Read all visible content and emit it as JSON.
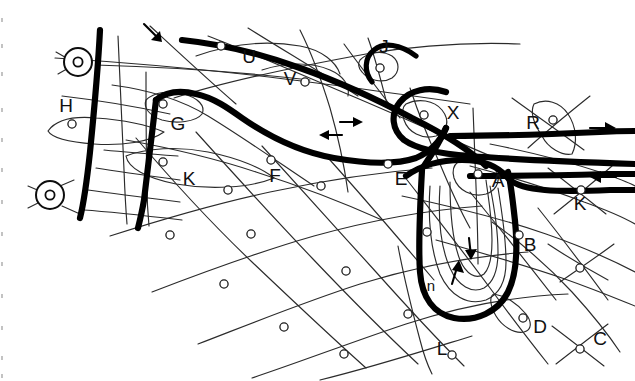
{
  "diagram": {
    "background_color": "#ffffff",
    "ink_color": "#000000",
    "width": 635,
    "height": 381,
    "labels": [
      {
        "id": "H",
        "text": "H",
        "x": 66,
        "y": 107
      },
      {
        "id": "G",
        "text": "G",
        "x": 178,
        "y": 125
      },
      {
        "id": "K1",
        "text": "K",
        "x": 189,
        "y": 180
      },
      {
        "id": "F",
        "text": "F",
        "x": 275,
        "y": 177
      },
      {
        "id": "U",
        "text": "U",
        "x": 249,
        "y": 58
      },
      {
        "id": "V",
        "text": "V",
        "x": 290,
        "y": 80
      },
      {
        "id": "J",
        "text": "J",
        "x": 384,
        "y": 48
      },
      {
        "id": "X",
        "text": "X",
        "x": 453,
        "y": 114
      },
      {
        "id": "E",
        "text": "E",
        "x": 401,
        "y": 180
      },
      {
        "id": "A",
        "text": "A",
        "x": 498,
        "y": 182
      },
      {
        "id": "R",
        "text": "R",
        "x": 533,
        "y": 124
      },
      {
        "id": "K2",
        "text": "K",
        "x": 580,
        "y": 205
      },
      {
        "id": "B",
        "text": "B",
        "x": 530,
        "y": 246
      },
      {
        "id": "n",
        "text": "n",
        "x": 431,
        "y": 287
      },
      {
        "id": "D",
        "text": "D",
        "x": 540,
        "y": 328
      },
      {
        "id": "C",
        "text": "C",
        "x": 600,
        "y": 340
      },
      {
        "id": "L",
        "text": "L",
        "x": 442,
        "y": 350
      }
    ],
    "arrows": [
      {
        "id": "top-diagonal-arrow",
        "direction": "down-right",
        "x": 152,
        "y": 30
      },
      {
        "id": "mid-right-arrow",
        "direction": "right",
        "x": 352,
        "y": 122
      },
      {
        "id": "mid-left-arrow",
        "direction": "left",
        "x": 331,
        "y": 135
      },
      {
        "id": "far-right-arrow",
        "direction": "right",
        "x": 604,
        "y": 132
      },
      {
        "id": "far-right-back-arrow",
        "direction": "left",
        "x": 604,
        "y": 177
      },
      {
        "id": "loop-down-arrow",
        "direction": "down",
        "x": 471,
        "y": 248
      },
      {
        "id": "loop-up-arrow",
        "direction": "up",
        "x": 457,
        "y": 272
      }
    ],
    "station_symbols": [
      {
        "id": "station-upper-left",
        "x": 78,
        "y": 62
      },
      {
        "id": "station-lower-left",
        "x": 50,
        "y": 195
      }
    ],
    "nodes": [
      {
        "id": "node-H",
        "x": 72,
        "y": 124
      },
      {
        "id": "node-G",
        "x": 163,
        "y": 104
      },
      {
        "id": "node-U",
        "x": 221,
        "y": 46
      },
      {
        "id": "node-V",
        "x": 305,
        "y": 82
      },
      {
        "id": "node-J",
        "x": 380,
        "y": 68
      },
      {
        "id": "node-X",
        "x": 424,
        "y": 115
      },
      {
        "id": "node-R",
        "x": 553,
        "y": 120
      },
      {
        "id": "node-K1",
        "x": 163,
        "y": 162
      },
      {
        "id": "node-F",
        "x": 271,
        "y": 160
      },
      {
        "id": "node-E",
        "x": 388,
        "y": 164
      },
      {
        "id": "node-A",
        "x": 478,
        "y": 174
      },
      {
        "id": "node-K2",
        "x": 581,
        "y": 190
      },
      {
        "id": "node-B",
        "x": 519,
        "y": 235
      },
      {
        "id": "node-D",
        "x": 523,
        "y": 318
      },
      {
        "id": "node-C",
        "x": 580,
        "y": 349
      },
      {
        "id": "node-grid-1",
        "x": 251,
        "y": 234
      },
      {
        "id": "node-grid-2",
        "x": 224,
        "y": 284
      },
      {
        "id": "node-grid-3",
        "x": 284,
        "y": 327
      },
      {
        "id": "node-grid-4",
        "x": 344,
        "y": 354
      },
      {
        "id": "node-grid-5",
        "x": 346,
        "y": 271
      },
      {
        "id": "node-grid-6",
        "x": 408,
        "y": 314
      },
      {
        "id": "node-grid-7",
        "x": 228,
        "y": 190
      },
      {
        "id": "node-grid-8",
        "x": 170,
        "y": 235
      },
      {
        "id": "node-grid-9",
        "x": 452,
        "y": 355
      },
      {
        "id": "node-grid-10",
        "x": 580,
        "y": 268
      },
      {
        "id": "node-grid-11",
        "x": 427,
        "y": 232
      },
      {
        "id": "node-grid-12",
        "x": 321,
        "y": 186
      }
    ]
  }
}
